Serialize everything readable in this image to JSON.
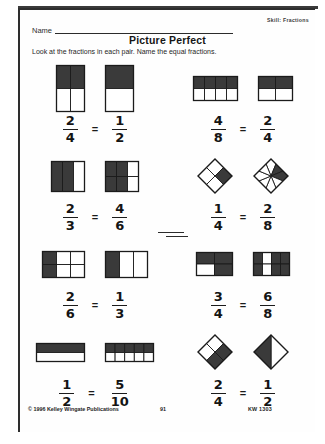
{
  "worksheet": {
    "skill_label": "Skill: Fractions",
    "name_label": "Name",
    "title": "Picture Perfect",
    "instructions": "Look at the fractions in each pair.  Name the equal fractions.",
    "equals_symbol": "="
  },
  "footer": {
    "copyright": "© 1996 Kelley Wingate Publications",
    "page_number": "91",
    "code": "KW 1303"
  },
  "problems": [
    {
      "id": "problem-1",
      "position": "row1-left",
      "left": {
        "numerator": "2",
        "denominator": "4",
        "shape": "vertical-bar",
        "cols": 2,
        "rows": 2,
        "shaded_cells": [
          0,
          1
        ],
        "width": 28,
        "height": 46
      },
      "right": {
        "numerator": "1",
        "denominator": "2",
        "shape": "vertical-bar",
        "cols": 1,
        "rows": 2,
        "shaded_cells": [
          0
        ],
        "width": 28,
        "height": 46
      }
    },
    {
      "id": "problem-2",
      "position": "row1-right",
      "left": {
        "numerator": "4",
        "denominator": "8",
        "shape": "rect-grid",
        "cols": 4,
        "rows": 2,
        "shaded_cells": [
          0,
          1,
          2,
          3
        ],
        "width": 44,
        "height": 24
      },
      "right": {
        "numerator": "2",
        "denominator": "4",
        "shape": "rect-grid",
        "cols": 2,
        "rows": 2,
        "shaded_cells": [
          0,
          1
        ],
        "width": 34,
        "height": 24
      }
    },
    {
      "id": "problem-3",
      "position": "row2-left",
      "left": {
        "numerator": "2",
        "denominator": "3",
        "shape": "rect-grid",
        "cols": 3,
        "rows": 1,
        "shaded_cells": [
          0,
          1
        ],
        "width": 33,
        "height": 30
      },
      "right": {
        "numerator": "4",
        "denominator": "6",
        "shape": "rect-grid",
        "cols": 3,
        "rows": 2,
        "shaded_cells": [
          0,
          1,
          3,
          4
        ],
        "width": 33,
        "height": 30
      }
    },
    {
      "id": "problem-4",
      "position": "row2-right",
      "left": {
        "numerator": "1",
        "denominator": "4",
        "shape": "diamond-4",
        "wedges": 4,
        "shaded_cells": [
          1
        ],
        "width": 34,
        "height": 34
      },
      "right": {
        "numerator": "2",
        "denominator": "8",
        "shape": "diamond-8",
        "wedges": 8,
        "shaded_cells": [
          1,
          2
        ],
        "width": 34,
        "height": 34
      }
    },
    {
      "id": "problem-5",
      "position": "row3-left",
      "left": {
        "numerator": "2",
        "denominator": "6",
        "shape": "rect-grid",
        "cols": 3,
        "rows": 2,
        "shaded_cells": [
          0,
          3
        ],
        "width": 42,
        "height": 26
      },
      "right": {
        "numerator": "1",
        "denominator": "3",
        "shape": "rect-grid",
        "cols": 3,
        "rows": 1,
        "shaded_cells": [
          0
        ],
        "width": 42,
        "height": 26
      }
    },
    {
      "id": "problem-6",
      "position": "row3-right",
      "left": {
        "numerator": "3",
        "denominator": "4",
        "shape": "rect-grid",
        "cols": 2,
        "rows": 2,
        "shaded_cells": [
          0,
          1,
          3
        ],
        "width": 36,
        "height": 23
      },
      "right": {
        "numerator": "6",
        "denominator": "8",
        "shape": "rect-grid",
        "cols": 4,
        "rows": 2,
        "shaded_cells": [
          0,
          2,
          3,
          4,
          6,
          7
        ],
        "width": 36,
        "height": 23
      }
    },
    {
      "id": "problem-7",
      "position": "row4-left",
      "left": {
        "numerator": "1",
        "denominator": "2",
        "shape": "rect-grid",
        "cols": 1,
        "rows": 2,
        "shaded_cells": [
          0
        ],
        "width": 48,
        "height": 18
      },
      "right": {
        "numerator": "5",
        "denominator": "10",
        "shape": "rect-grid",
        "cols": 5,
        "rows": 2,
        "shaded_cells": [
          0,
          1,
          2,
          3,
          4
        ],
        "width": 48,
        "height": 18
      }
    },
    {
      "id": "problem-8",
      "position": "row4-right",
      "left": {
        "numerator": "2",
        "denominator": "4",
        "shape": "diamond-4",
        "wedges": 4,
        "shaded_cells": [
          1,
          2
        ],
        "width": 34,
        "height": 34
      },
      "right": {
        "numerator": "1",
        "denominator": "2",
        "shape": "diamond-2",
        "wedges": 2,
        "shaded_cells": [
          1
        ],
        "width": 34,
        "height": 34
      }
    }
  ],
  "colors": {
    "shaded_fill": "#3a3a3a",
    "unshaded_fill": "#ffffff",
    "stroke": "#1b1b1b",
    "page_background": "#ffffff"
  }
}
